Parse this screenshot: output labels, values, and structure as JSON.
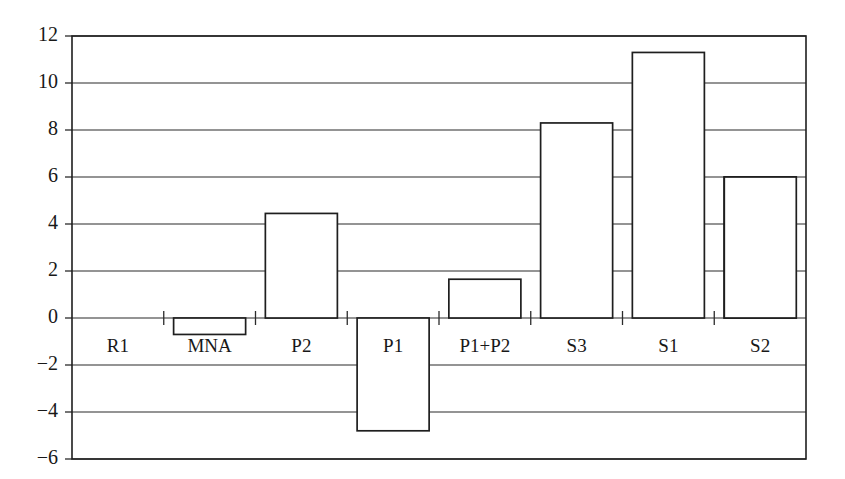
{
  "chart_data": {
    "type": "bar",
    "title": "",
    "subtitle": "",
    "xlabel": "",
    "ylabel": "",
    "categories": [
      "R1",
      "MNA",
      "P2",
      "P1",
      "P1+P2",
      "S3",
      "S1",
      "S2"
    ],
    "values": [
      4.6,
      -0.7,
      4.45,
      -4.8,
      1.65,
      8.3,
      11.3,
      6.0
    ],
    "ylim": [
      -6,
      12
    ],
    "ytick_labels": [
      "12",
      "10",
      "8",
      "6",
      "4",
      "2",
      "0",
      "−2",
      "−4",
      "−6"
    ],
    "yticks": [
      12,
      10,
      8,
      6,
      4,
      2,
      0,
      -2,
      -4,
      -6
    ],
    "grid": true,
    "grid_axis": "y",
    "legend": "none",
    "bar_fill": "#ffffff",
    "bar_edge": "#1e1e1e",
    "axis_color": "#1e1e1e",
    "background": "#ffffff",
    "series": [
      {
        "name": "values",
        "points": [
          {
            "category": "R1",
            "value": 4.6
          },
          {
            "category": "MNA",
            "value": -0.7
          },
          {
            "category": "P2",
            "value": 4.45
          },
          {
            "category": "P1",
            "value": -4.8
          },
          {
            "category": "P1+P2",
            "value": 1.65
          },
          {
            "category": "S3",
            "value": 8.3
          },
          {
            "category": "S1",
            "value": 11.3
          },
          {
            "category": "S2",
            "value": 6.0
          }
        ]
      }
    ]
  },
  "axis": {
    "y_tick_0": "12",
    "y_tick_1": "10",
    "y_tick_2": "8",
    "y_tick_3": "6",
    "y_tick_4": "4",
    "y_tick_5": "2",
    "y_tick_6": "0",
    "y_tick_7": "−2",
    "y_tick_8": "−4",
    "y_tick_9": "−6"
  },
  "categories": {
    "cat_0": "R1",
    "cat_1": "MNA",
    "cat_2": "P2",
    "cat_3": "P1",
    "cat_4": "P1+P2",
    "cat_5": "S3",
    "cat_6": "S1",
    "cat_7": "S2"
  }
}
